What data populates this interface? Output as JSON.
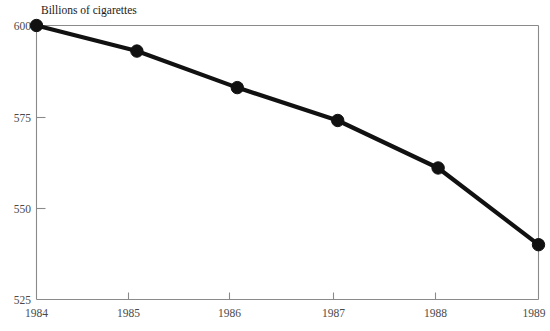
{
  "chart_data": {
    "type": "line",
    "title": "Billions of cigarettes",
    "xlabel": "",
    "ylabel": "",
    "categories": [
      "1984",
      "1985",
      "1986",
      "1987",
      "1988",
      "1989"
    ],
    "x": [
      1984,
      1985,
      1986,
      1987,
      1988,
      1989
    ],
    "values": [
      600,
      593,
      583,
      574,
      561,
      540
    ],
    "series": [
      {
        "name": "Billions of cigarettes",
        "values": [
          600,
          593,
          583,
          574,
          561,
          540
        ]
      }
    ],
    "xlim": [
      1984,
      1989
    ],
    "ylim": [
      525,
      600
    ],
    "ytick_labels": [
      "525",
      "550",
      "575",
      "600"
    ],
    "yticks": [
      525,
      550,
      575,
      600
    ],
    "xtick_labels": [
      "1984",
      "1985",
      "1986",
      "1987",
      "1988",
      "1989"
    ],
    "grid": false,
    "legend": false,
    "legend_position": "none",
    "line_color": "#111111",
    "marker": "circle",
    "marker_color": "#111111",
    "axis_color": "#8a8a8a",
    "background_color": "#ffffff"
  },
  "axis_labels": {
    "y": [
      "600",
      "575",
      "550",
      "525"
    ],
    "x": [
      "1984",
      "1985",
      "1986",
      "1987",
      "1988",
      "1989"
    ]
  }
}
